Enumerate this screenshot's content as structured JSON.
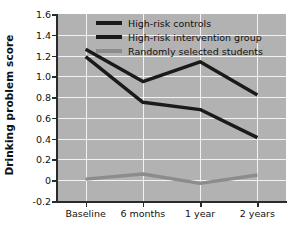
{
  "chart_data": {
    "type": "line",
    "title": "",
    "xlabel": "",
    "ylabel": "Drinking problem score",
    "categories": [
      "Baseline",
      "6 months",
      "1 year",
      "2 years"
    ],
    "ylim": [
      -0.2,
      1.6
    ],
    "yticks": [
      "1.6",
      "1.4",
      "1.2",
      "1.0",
      "0.8",
      "0.6",
      "0.4",
      "0.2",
      "0",
      "-0.2"
    ],
    "ytick_values": [
      1.6,
      1.4,
      1.2,
      1.0,
      0.8,
      0.6,
      0.4,
      0.2,
      0.0,
      -0.2
    ],
    "grid": true,
    "legend_position": "top-center",
    "plot_background": "#b2b2b2",
    "gridline_color": "#f2f2f2",
    "series": [
      {
        "name": "High-risk controls",
        "color": "#1a1a1a",
        "values": [
          1.26,
          0.95,
          1.14,
          0.82
        ]
      },
      {
        "name": "High-risk intervention group",
        "color": "#1a1a1a",
        "values": [
          1.19,
          0.75,
          0.68,
          0.41
        ]
      },
      {
        "name": "Randomly selected students",
        "color": "#8c8c8c",
        "values": [
          0.01,
          0.06,
          -0.03,
          0.05
        ]
      }
    ]
  },
  "legend": {
    "items": [
      {
        "label": "High-risk controls",
        "color": "#1a1a1a"
      },
      {
        "label": "High-risk intervention group",
        "color": "#1a1a1a"
      },
      {
        "label": "Randomly selected students",
        "color": "#8c8c8c"
      }
    ]
  }
}
